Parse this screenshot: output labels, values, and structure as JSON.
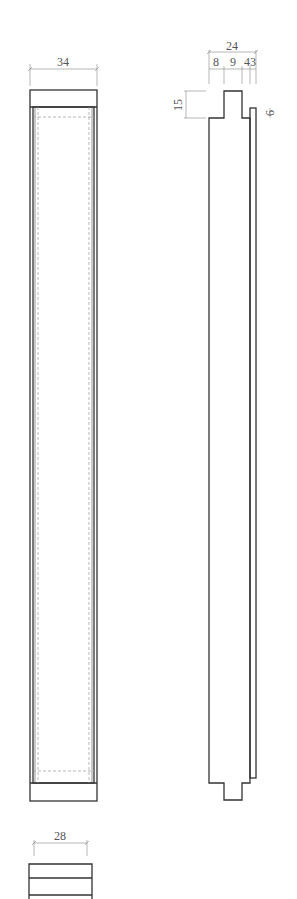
{
  "drawing": {
    "front_view": {
      "width_label": "34"
    },
    "side_view": {
      "total_width_label": "24",
      "segments": [
        "8",
        "9",
        "4",
        "3"
      ],
      "segment_label_combined": "43",
      "tongue_height_label": "15",
      "panel_offset_label": "6"
    },
    "section_view": {
      "width_label": "28"
    }
  }
}
